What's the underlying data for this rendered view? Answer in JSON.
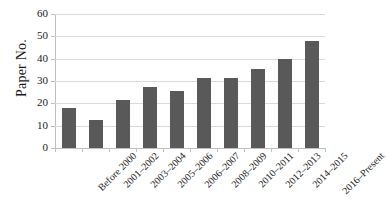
{
  "chart_data": {
    "type": "bar",
    "title": "",
    "xlabel": "",
    "ylabel": "Paper No.",
    "ylim": [
      0,
      60
    ],
    "yticks": [
      0,
      10,
      20,
      30,
      40,
      50,
      60
    ],
    "grid": true,
    "legend": "none",
    "bar_color": "#595959",
    "gridline_color": "#d9d9d9",
    "axis_color": "#bfbfbf",
    "categories": [
      "Before 2000",
      "2001–2002",
      "2003–2004",
      "2005–2006",
      "2006–2007",
      "2008–2009",
      "2010–2011",
      "2012–2013",
      "2014–2015",
      "2016–Present"
    ],
    "values": [
      18,
      12.5,
      21.5,
      27.5,
      25.5,
      31.5,
      31.5,
      35.5,
      40,
      48
    ]
  }
}
